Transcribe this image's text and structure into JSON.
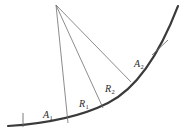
{
  "figure": {
    "type": "geometric-diagram",
    "background_color": "#ffffff",
    "width": 184,
    "height": 134,
    "curve": {
      "name": "main-arc",
      "color": "#3a3a3a",
      "stroke_width": 2.1,
      "description": "concave-up arc rising left to right",
      "path": "M 8 126 C 40 124, 78 118, 108 103 C 134 90, 158 58, 178 6"
    },
    "apex": {
      "name": "apex-vertex",
      "x": 56,
      "y": 5
    },
    "radial_lines": [
      {
        "name": "radial-line-1",
        "x1": 56,
        "y1": 5,
        "x2": 68,
        "y2": 123,
        "color": "#6e6e6e",
        "stroke_width": 0.8
      },
      {
        "name": "radial-line-2",
        "x1": 56,
        "y1": 5,
        "x2": 103,
        "y2": 108,
        "color": "#6e6e6e",
        "stroke_width": 0.8
      },
      {
        "name": "radial-line-3",
        "x1": 56,
        "y1": 5,
        "x2": 131,
        "y2": 82,
        "color": "#6e6e6e",
        "stroke_width": 0.8
      }
    ],
    "tick_marks": [
      {
        "name": "tick-mark-left",
        "x1": 23,
        "y1": 113,
        "x2": 23,
        "y2": 127,
        "color": "#6e6e6e",
        "stroke_width": 0.9
      },
      {
        "name": "tick-mark-right",
        "x1": 152,
        "y1": 55,
        "x2": 168,
        "y2": 40,
        "color": "#6e6e6e",
        "stroke_width": 0.9
      }
    ],
    "labels": [
      {
        "id": "A1",
        "base": "A",
        "subscript": "1",
        "x": 43,
        "y": 110
      },
      {
        "id": "R1",
        "base": "R",
        "subscript": "1",
        "x": 79,
        "y": 99
      },
      {
        "id": "R2",
        "base": "R",
        "subscript": "2",
        "x": 105,
        "y": 84
      },
      {
        "id": "A2",
        "base": "A",
        "subscript": "2",
        "x": 134,
        "y": 59
      }
    ]
  }
}
